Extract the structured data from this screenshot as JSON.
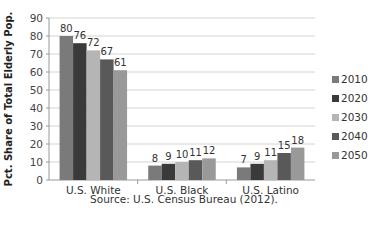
{
  "chart_data": {
    "type": "bar",
    "title": "",
    "xlabel": "",
    "ylabel": "Pct. Share of Total Elderly Pop.",
    "ylim": [
      0,
      90
    ],
    "yticks": [
      0,
      10,
      20,
      30,
      40,
      50,
      60,
      70,
      80,
      90
    ],
    "grid": true,
    "legend_position": "right",
    "categories": [
      "U.S. White",
      "U.S. Black",
      "U.S. Latino"
    ],
    "series": [
      {
        "name": "2010",
        "color": "#7a7a7a",
        "values": [
          80,
          8,
          7
        ]
      },
      {
        "name": "2020",
        "color": "#3a3a3a",
        "values": [
          76,
          9,
          9
        ]
      },
      {
        "name": "2030",
        "color": "#b5b5b5",
        "values": [
          72,
          10,
          11
        ]
      },
      {
        "name": "2040",
        "color": "#595959",
        "values": [
          67,
          11,
          15
        ]
      },
      {
        "name": "2050",
        "color": "#999999",
        "values": [
          61,
          12,
          18
        ]
      }
    ],
    "source_note": "Source: U.S. Census Bureau (2012)."
  }
}
